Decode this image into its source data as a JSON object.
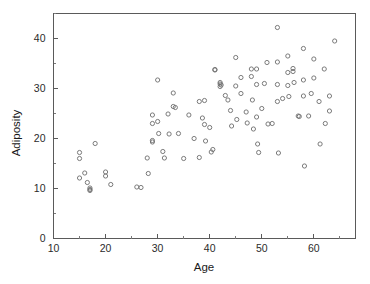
{
  "chart_data": {
    "type": "scatter",
    "title": "",
    "xlabel": "Age",
    "ylabel": "Adiposity",
    "xlim": [
      10,
      68
    ],
    "ylim": [
      0,
      45
    ],
    "grid": false,
    "legend": null,
    "marker": {
      "shape": "open-circle",
      "radius": 2.1,
      "stroke": "#6d6d6d",
      "fill": "none"
    },
    "axis_color": "#5a5a5a",
    "background": "#ffffff",
    "xticks": [
      10,
      20,
      30,
      40,
      50,
      60
    ],
    "xtick_labels": [
      "10",
      "20",
      "30",
      "40",
      "50",
      "60"
    ],
    "xticks_minor": [
      15,
      25,
      35,
      45,
      55,
      65
    ],
    "yticks": [
      0,
      10,
      20,
      30,
      40
    ],
    "ytick_labels": [
      "0",
      "10",
      "20",
      "30",
      "40"
    ],
    "yticks_minor": [
      5,
      15,
      25,
      35,
      45
    ],
    "n_points": 104,
    "points": [
      [
        15.0,
        17.2
      ],
      [
        15.0,
        16.0
      ],
      [
        15.0,
        12.1
      ],
      [
        16.0,
        13.1
      ],
      [
        16.5,
        11.2
      ],
      [
        17.0,
        10.1
      ],
      [
        17.0,
        9.8
      ],
      [
        17.0,
        9.6
      ],
      [
        18.0,
        19.0
      ],
      [
        20.0,
        13.3
      ],
      [
        20.0,
        12.5
      ],
      [
        21.0,
        10.8
      ],
      [
        26.0,
        10.3
      ],
      [
        26.8,
        10.2
      ],
      [
        28.0,
        16.1
      ],
      [
        28.2,
        13.0
      ],
      [
        29.0,
        24.7
      ],
      [
        29.0,
        23.0
      ],
      [
        29.0,
        19.6
      ],
      [
        29.0,
        19.3
      ],
      [
        30.0,
        31.7
      ],
      [
        30.0,
        23.4
      ],
      [
        30.2,
        21.0
      ],
      [
        31.0,
        17.4
      ],
      [
        31.3,
        16.1
      ],
      [
        32.0,
        24.9
      ],
      [
        32.2,
        20.9
      ],
      [
        33.0,
        29.1
      ],
      [
        33.0,
        26.4
      ],
      [
        33.4,
        26.2
      ],
      [
        36.0,
        24.7
      ],
      [
        38.0,
        27.4
      ],
      [
        38.0,
        16.2
      ],
      [
        38.6,
        24.1
      ],
      [
        39.0,
        27.6
      ],
      [
        39.0,
        22.8
      ],
      [
        39.2,
        19.5
      ],
      [
        40.0,
        22.2
      ],
      [
        40.3,
        17.3
      ],
      [
        40.6,
        17.8
      ],
      [
        41.0,
        33.8
      ],
      [
        41.0,
        33.7
      ],
      [
        42.0,
        31.2
      ],
      [
        42.0,
        30.9
      ],
      [
        42.0,
        30.4
      ],
      [
        42.2,
        30.7
      ],
      [
        43.5,
        27.7
      ],
      [
        44.0,
        25.6
      ],
      [
        44.2,
        22.5
      ],
      [
        45.0,
        36.2
      ],
      [
        45.0,
        30.5
      ],
      [
        45.2,
        23.8
      ],
      [
        46.0,
        32.2
      ],
      [
        46.0,
        29.0
      ],
      [
        47.0,
        25.3
      ],
      [
        47.2,
        23.1
      ],
      [
        48.0,
        33.9
      ],
      [
        48.0,
        32.4
      ],
      [
        48.2,
        27.7
      ],
      [
        48.4,
        21.9
      ],
      [
        49.0,
        33.9
      ],
      [
        49.0,
        30.8
      ],
      [
        49.0,
        24.3
      ],
      [
        49.2,
        18.9
      ],
      [
        49.4,
        17.2
      ],
      [
        51.0,
        35.2
      ],
      [
        51.2,
        22.9
      ],
      [
        52.0,
        23.0
      ],
      [
        53.0,
        42.2
      ],
      [
        53.0,
        35.3
      ],
      [
        53.0,
        30.8
      ],
      [
        53.0,
        27.4
      ],
      [
        53.2,
        17.1
      ],
      [
        54.0,
        28.0
      ],
      [
        55.0,
        36.5
      ],
      [
        55.0,
        33.2
      ],
      [
        55.0,
        30.6
      ],
      [
        55.2,
        28.4
      ],
      [
        56.0,
        34.0
      ],
      [
        56.0,
        33.4
      ],
      [
        56.2,
        31.2
      ],
      [
        57.0,
        24.5
      ],
      [
        57.2,
        24.4
      ],
      [
        58.0,
        38.0
      ],
      [
        58.0,
        31.7
      ],
      [
        58.0,
        28.5
      ],
      [
        58.2,
        14.5
      ],
      [
        60.0,
        35.9
      ],
      [
        60.0,
        32.1
      ],
      [
        61.0,
        27.4
      ],
      [
        61.2,
        18.9
      ],
      [
        62.0,
        33.9
      ],
      [
        62.2,
        23.0
      ],
      [
        63.0,
        28.5
      ],
      [
        63.0,
        25.5
      ],
      [
        64.0,
        39.5
      ],
      [
        34.0,
        21.0
      ],
      [
        35.0,
        16.0
      ],
      [
        37.0,
        20.0
      ],
      [
        43.0,
        28.6
      ],
      [
        50.0,
        26.0
      ],
      [
        50.5,
        31.0
      ],
      [
        59.0,
        24.5
      ],
      [
        59.5,
        29.0
      ]
    ]
  }
}
